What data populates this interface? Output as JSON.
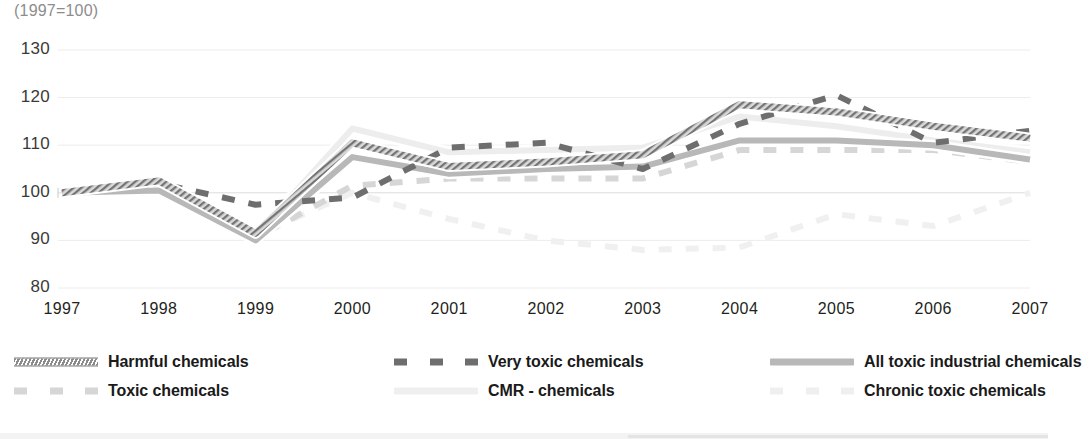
{
  "chart_data": {
    "type": "line",
    "title": "",
    "subtitle": "(1997=100)",
    "xlabel": "",
    "ylabel": "",
    "index_note": "(1997=100)",
    "grid": true,
    "legend_position": "bottom",
    "x": [
      1997,
      1998,
      1999,
      2000,
      2001,
      2002,
      2003,
      2004,
      2005,
      2006,
      2007
    ],
    "categories": [
      "1997",
      "1998",
      "1999",
      "2000",
      "2001",
      "2002",
      "2003",
      "2004",
      "2005",
      "2006",
      "2007"
    ],
    "xlim": [
      1997,
      2007
    ],
    "ylim": [
      80,
      130
    ],
    "yticks": [
      "130",
      "120",
      "110",
      "100",
      "90",
      "80"
    ],
    "ytick_values": [
      130,
      120,
      110,
      100,
      90,
      80
    ],
    "series": [
      {
        "name": "Harmful chemicals",
        "style": "hatched-thick",
        "color": "#7d7d7d",
        "values": [
          100.0,
          102.5,
          91.5,
          110.5,
          105.5,
          106.5,
          108.0,
          118.5,
          117.0,
          114.0,
          111.5
        ]
      },
      {
        "name": "Very toxic chemicals",
        "style": "dashed",
        "color": "#6e6e6e",
        "values": [
          100.0,
          102.0,
          97.5,
          99.0,
          109.5,
          110.5,
          105.0,
          114.5,
          120.5,
          110.5,
          113.0
        ]
      },
      {
        "name": "All toxic industrial chemicals",
        "style": "solid",
        "color": "#b8b8b8",
        "values": [
          100.0,
          100.5,
          90.0,
          107.5,
          104.0,
          105.0,
          105.5,
          111.0,
          111.0,
          110.0,
          107.0
        ]
      },
      {
        "name": "Toxic chemicals",
        "style": "dashed",
        "color": "#d6d6d6",
        "values": [
          100.0,
          100.0,
          90.5,
          101.5,
          103.0,
          103.0,
          103.0,
          109.0,
          109.0,
          109.0,
          106.5
        ]
      },
      {
        "name": "CMR - chemicals",
        "style": "solid",
        "color": "#ededed",
        "values": [
          100.0,
          100.5,
          91.0,
          113.5,
          108.5,
          109.0,
          109.5,
          116.0,
          114.0,
          111.0,
          108.5
        ]
      },
      {
        "name": "Chronic toxic chemicals",
        "style": "dashed",
        "color": "#f0f0f0",
        "values": [
          100.0,
          100.0,
          91.0,
          100.0,
          94.5,
          90.0,
          88.0,
          88.5,
          95.5,
          93.0,
          100.0
        ]
      }
    ]
  },
  "axis": {
    "y_ticks": [
      {
        "label": "130"
      },
      {
        "label": "120"
      },
      {
        "label": "110"
      },
      {
        "label": "100"
      },
      {
        "label": "90"
      },
      {
        "label": "80"
      }
    ],
    "x_ticks": [
      {
        "label": "1997"
      },
      {
        "label": "1998"
      },
      {
        "label": "1999"
      },
      {
        "label": "2000"
      },
      {
        "label": "2001"
      },
      {
        "label": "2002"
      },
      {
        "label": "2003"
      },
      {
        "label": "2004"
      },
      {
        "label": "2005"
      },
      {
        "label": "2006"
      },
      {
        "label": "2007"
      }
    ]
  },
  "legend": {
    "items": [
      {
        "label": "Harmful chemicals",
        "swatch": "hatched-swatch",
        "color": "#7d7d7d"
      },
      {
        "label": "Very toxic chemicals",
        "swatch": "dashed-swatch",
        "color": "#6e6e6e"
      },
      {
        "label": "All toxic industrial chemicals",
        "swatch": "solid-swatch",
        "color": "#b8b8b8"
      },
      {
        "label": "Toxic chemicals",
        "swatch": "dashed-swatch",
        "color": "#d6d6d6"
      },
      {
        "label": "CMR - chemicals",
        "swatch": "solid-swatch",
        "color": "#efefef"
      },
      {
        "label": "Chronic toxic chemicals",
        "swatch": "dashed-swatch",
        "color": "#efefef"
      }
    ]
  }
}
